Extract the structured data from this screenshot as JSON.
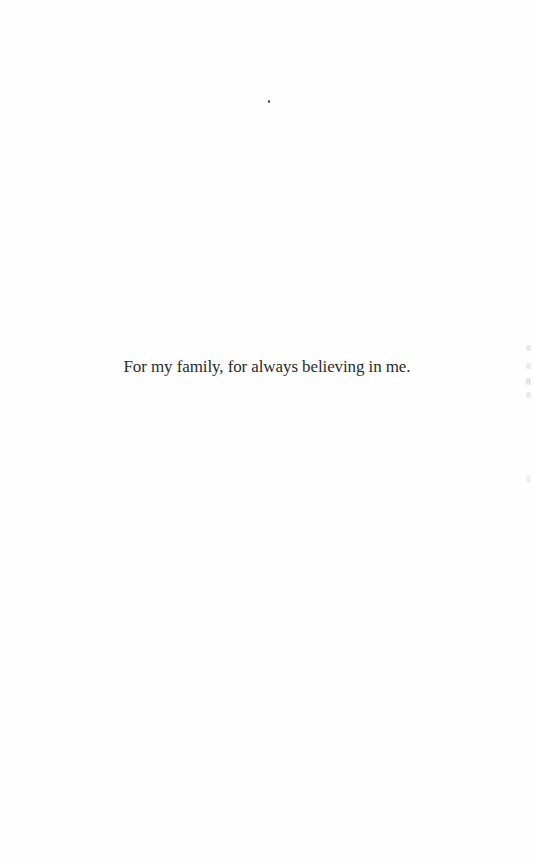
{
  "page": {
    "type": "dedication",
    "background_color": "#fefefe",
    "text_color": "#2b2b2b"
  },
  "dedication": {
    "text": "For my family, for always believing in me."
  }
}
